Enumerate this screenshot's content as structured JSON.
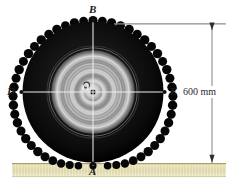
{
  "labels": {
    "top": "B",
    "left": "D",
    "center": "O",
    "right": "E",
    "bottom": "A"
  },
  "dimension": {
    "value": "600 mm"
  },
  "colors": {
    "tire": "#0b0b0b",
    "tire_edge": "#000000",
    "rim_light": "#d9d9d9",
    "rim_mid": "#9a9a9a",
    "rim_dark": "#4a4a4a",
    "hub_dot": "#0a0a0a",
    "crosshair": "#e8e8e8",
    "ground_fill": "#e4dfb4",
    "ground_top": "#b9b278",
    "dimension_line": "#7a7a7a",
    "background": "#ffffff"
  },
  "geometry": {
    "center_x": 93,
    "center_y": 92,
    "tire_outer_radius": 72,
    "rim_radius": 42,
    "dimension_x": 212,
    "dimension_top_y": 24,
    "dimension_bottom_y": 163,
    "ground_y": 163
  }
}
